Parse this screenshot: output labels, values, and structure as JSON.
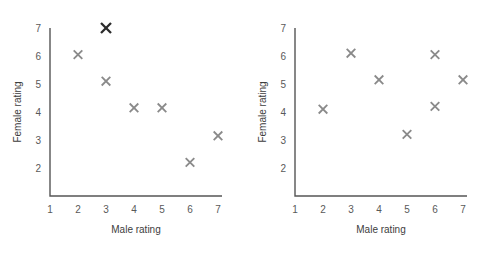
{
  "figure": {
    "background": "#ffffff",
    "marker_color": "#8a8a8a",
    "marker_highlight_color": "#2b2b2b",
    "axis_color": "#555555",
    "label_color": "#595959"
  },
  "chart_data": [
    {
      "type": "scatter",
      "name": "left-panel",
      "title": "",
      "xlabel": "Male rating",
      "ylabel": "Female rating",
      "xlim": [
        1,
        7
      ],
      "ylim": [
        1,
        7
      ],
      "xticks": [
        1,
        2,
        3,
        4,
        5,
        6,
        7
      ],
      "yticks": [
        2,
        3,
        4,
        5,
        6,
        7
      ],
      "xtick_labels": [
        "1",
        "2",
        "3",
        "4",
        "5",
        "6",
        "7"
      ],
      "ytick_labels": [
        "2",
        "3",
        "4",
        "5",
        "6",
        "7"
      ],
      "grid": false,
      "legend": null,
      "points": [
        {
          "x": 2,
          "y": 6.05,
          "style": "normal"
        },
        {
          "x": 3,
          "y": 7.0,
          "style": "highlight"
        },
        {
          "x": 3,
          "y": 5.1,
          "style": "normal"
        },
        {
          "x": 4,
          "y": 4.15,
          "style": "normal"
        },
        {
          "x": 5,
          "y": 4.15,
          "style": "normal"
        },
        {
          "x": 6,
          "y": 2.2,
          "style": "normal"
        },
        {
          "x": 7,
          "y": 3.15,
          "style": "normal"
        }
      ]
    },
    {
      "type": "scatter",
      "name": "right-panel",
      "title": "",
      "xlabel": "Male rating",
      "ylabel": "Female rating",
      "xlim": [
        1,
        7
      ],
      "ylim": [
        1,
        7
      ],
      "xticks": [
        1,
        2,
        3,
        4,
        5,
        6,
        7
      ],
      "yticks": [
        2,
        3,
        4,
        5,
        6,
        7
      ],
      "xtick_labels": [
        "1",
        "2",
        "3",
        "4",
        "5",
        "6",
        "7"
      ],
      "ytick_labels": [
        "2",
        "3",
        "4",
        "5",
        "6",
        "7"
      ],
      "grid": false,
      "legend": null,
      "points": [
        {
          "x": 2,
          "y": 4.1,
          "style": "normal"
        },
        {
          "x": 3,
          "y": 6.1,
          "style": "normal"
        },
        {
          "x": 4,
          "y": 5.15,
          "style": "normal"
        },
        {
          "x": 5,
          "y": 3.2,
          "style": "normal"
        },
        {
          "x": 6,
          "y": 6.05,
          "style": "normal"
        },
        {
          "x": 6,
          "y": 4.2,
          "style": "normal"
        },
        {
          "x": 7,
          "y": 5.15,
          "style": "normal"
        }
      ]
    }
  ]
}
